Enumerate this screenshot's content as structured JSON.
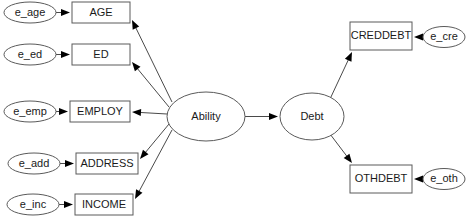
{
  "diagram": {
    "type": "sem-path-diagram",
    "background_color": "#ffffff",
    "node_stroke_color": "#5a5a5a",
    "edge_color": "#4a4a4a",
    "arrow_color": "#000000",
    "label_color": "#1a1a1a",
    "latent_variables": [
      {
        "id": "ability",
        "label": "Ability",
        "shape": "ellipse",
        "cx": 206,
        "cy": 116.5,
        "rx": 39,
        "ry": 24.5
      },
      {
        "id": "debt",
        "label": "Debt",
        "shape": "ellipse",
        "cx": 312,
        "cy": 116.5,
        "rx": 32,
        "ry": 23.5
      }
    ],
    "observed_variables": [
      {
        "id": "age",
        "label": "AGE",
        "shape": "rect",
        "x": 72,
        "y": 2,
        "w": 58,
        "h": 21
      },
      {
        "id": "ed",
        "label": "ED",
        "shape": "rect",
        "x": 72,
        "y": 44,
        "w": 58,
        "h": 21
      },
      {
        "id": "employ",
        "label": "EMPLOY",
        "shape": "rect",
        "x": 70,
        "y": 101,
        "w": 60,
        "h": 21
      },
      {
        "id": "address",
        "label": "ADDRESS",
        "shape": "rect",
        "x": 76,
        "y": 153,
        "w": 62,
        "h": 21
      },
      {
        "id": "income",
        "label": "INCOME",
        "shape": "rect",
        "x": 75,
        "y": 194,
        "w": 58,
        "h": 21
      },
      {
        "id": "creddebt",
        "label": "CREDDEBT",
        "shape": "rect",
        "x": 350,
        "y": 22,
        "w": 62,
        "h": 28
      },
      {
        "id": "othdebt",
        "label": "OTHDEBT",
        "shape": "rect",
        "x": 350,
        "y": 165,
        "w": 62,
        "h": 28
      }
    ],
    "error_terms": [
      {
        "id": "e_age",
        "label": "e_age",
        "shape": "ellipse",
        "cx": 30,
        "cy": 12.5,
        "rx": 26,
        "ry": 10.5
      },
      {
        "id": "e_ed",
        "label": "e_ed",
        "shape": "ellipse",
        "cx": 30,
        "cy": 54.5,
        "rx": 26,
        "ry": 10.5
      },
      {
        "id": "e_emp",
        "label": "e_emp",
        "shape": "ellipse",
        "cx": 30,
        "cy": 111.5,
        "rx": 26,
        "ry": 10.5
      },
      {
        "id": "e_add",
        "label": "e_add",
        "shape": "ellipse",
        "cx": 34,
        "cy": 163.5,
        "rx": 26,
        "ry": 10.5
      },
      {
        "id": "e_inc",
        "label": "e_inc",
        "shape": "ellipse",
        "cx": 33,
        "cy": 204.5,
        "rx": 26,
        "ry": 10.5
      },
      {
        "id": "e_cre",
        "label": "e_cre",
        "shape": "ellipse",
        "cx": 444,
        "cy": 37,
        "rx": 21,
        "ry": 10.5
      },
      {
        "id": "e_oth",
        "label": "e_oth",
        "shape": "ellipse",
        "cx": 444,
        "cy": 179,
        "rx": 21,
        "ry": 10.5
      }
    ],
    "edges": [
      {
        "id": "e_age-to-age",
        "from": "e_age",
        "to": "age",
        "x1": 56,
        "y1": 12.5,
        "x2": 70,
        "y2": 12.5
      },
      {
        "id": "e_ed-to-ed",
        "from": "e_ed",
        "to": "ed",
        "x1": 56,
        "y1": 54.5,
        "x2": 70,
        "y2": 54.5
      },
      {
        "id": "e_emp-to-employ",
        "from": "e_emp",
        "to": "employ",
        "x1": 56,
        "y1": 111.5,
        "x2": 68,
        "y2": 111.5
      },
      {
        "id": "e_add-to-address",
        "from": "e_add",
        "to": "address",
        "x1": 60,
        "y1": 163.5,
        "x2": 74,
        "y2": 163.5
      },
      {
        "id": "e_inc-to-income",
        "from": "e_inc",
        "to": "income",
        "x1": 59,
        "y1": 204.5,
        "x2": 73,
        "y2": 204.5
      },
      {
        "id": "ability-to-age",
        "from": "ability",
        "to": "age",
        "x1": 172,
        "y1": 102,
        "x2": 132,
        "y2": 20
      },
      {
        "id": "ability-to-ed",
        "from": "ability",
        "to": "ed",
        "x1": 169,
        "y1": 107,
        "x2": 132,
        "y2": 62
      },
      {
        "id": "ability-to-employ",
        "from": "ability",
        "to": "employ",
        "x1": 167,
        "y1": 114,
        "x2": 132,
        "y2": 112
      },
      {
        "id": "ability-to-address",
        "from": "ability",
        "to": "address",
        "x1": 169,
        "y1": 124,
        "x2": 140,
        "y2": 159
      },
      {
        "id": "ability-to-income",
        "from": "ability",
        "to": "income",
        "x1": 172,
        "y1": 130,
        "x2": 135,
        "y2": 199
      },
      {
        "id": "ability-to-debt",
        "from": "ability",
        "to": "debt",
        "x1": 245,
        "y1": 116.5,
        "x2": 278,
        "y2": 116.5
      },
      {
        "id": "debt-to-creddebt",
        "from": "debt",
        "to": "creddebt",
        "x1": 330,
        "y1": 99,
        "x2": 352,
        "y2": 52
      },
      {
        "id": "debt-to-othdebt",
        "from": "debt",
        "to": "othdebt",
        "x1": 330,
        "y1": 134,
        "x2": 352,
        "y2": 163
      },
      {
        "id": "e_cre-to-creddebt",
        "from": "e_cre",
        "to": "creddebt",
        "x1": 423,
        "y1": 37,
        "x2": 414,
        "y2": 37
      },
      {
        "id": "e_oth-to-othdebt",
        "from": "e_oth",
        "to": "othdebt",
        "x1": 423,
        "y1": 179,
        "x2": 414,
        "y2": 179
      }
    ]
  }
}
